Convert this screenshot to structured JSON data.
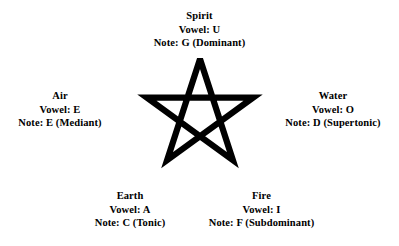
{
  "diagram": {
    "type": "pentagram-elements-correspondence",
    "shape": "pentagram",
    "stroke_color": "#000000",
    "background_color": "#ffffff",
    "points": [
      {
        "position": "top",
        "element": "Spirit",
        "vowel_line": "Vowel: U",
        "note_line": "Note: G (Dominant)",
        "vowel": "U",
        "note": "G",
        "function": "Dominant"
      },
      {
        "position": "left",
        "element": "Air",
        "vowel_line": "Vowel: E",
        "note_line": "Note: E (Mediant)",
        "vowel": "E",
        "note": "E",
        "function": "Mediant"
      },
      {
        "position": "right",
        "element": "Water",
        "vowel_line": "Vowel: O",
        "note_line": "Note: D (Supertonic)",
        "vowel": "O",
        "note": "D",
        "function": "Supertonic"
      },
      {
        "position": "bottom-left",
        "element": "Earth",
        "vowel_line": "Vowel: A",
        "note_line": "Note: C (Tonic)",
        "vowel": "A",
        "note": "C",
        "function": "Tonic"
      },
      {
        "position": "bottom-right",
        "element": "Fire",
        "vowel_line": "Vowel: I",
        "note_line": "Note: F (Subdominant)",
        "vowel": "I",
        "note": "F",
        "function": "Subdominant"
      }
    ]
  }
}
